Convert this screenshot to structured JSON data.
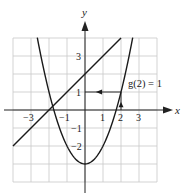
{
  "chart_data": {
    "type": "line",
    "title": "",
    "xlabel": "x",
    "ylabel": "y",
    "xlim": [
      -4,
      4
    ],
    "ylim": [
      -4,
      4
    ],
    "grid": true,
    "x_ticks": [
      {
        "value": -3,
        "label": "−3"
      },
      {
        "value": -1,
        "label": "−1"
      },
      {
        "value": 1,
        "label": "1"
      },
      {
        "value": 2,
        "label": "2"
      },
      {
        "value": 3,
        "label": "3"
      }
    ],
    "y_ticks": [
      {
        "value": 3,
        "label": "3"
      },
      {
        "value": 1,
        "label": "1"
      },
      {
        "value": -1,
        "label": "−1"
      },
      {
        "value": -2,
        "label": "−2"
      }
    ],
    "series": [
      {
        "name": "line",
        "equation": "y = x + 2",
        "x": [
          -4,
          2
        ],
        "y": [
          -2,
          4
        ]
      },
      {
        "name": "g",
        "equation": "g(x) = x^2 - 3",
        "x": [
          -2.65,
          -2,
          -1,
          0,
          1,
          2,
          2.65
        ],
        "y": [
          4.02,
          1,
          -2,
          -3,
          -2,
          1,
          4.02
        ]
      }
    ],
    "annotations": [
      {
        "text": "g(2) = 1",
        "x": 2,
        "y": 1,
        "guide": "vertical arrow from (2,0) up to (2,1), horizontal arrow from (2,1) left to y-axis"
      }
    ]
  },
  "labels": {
    "x_axis": "x",
    "y_axis": "y",
    "annotation": "g(2) = 1"
  }
}
